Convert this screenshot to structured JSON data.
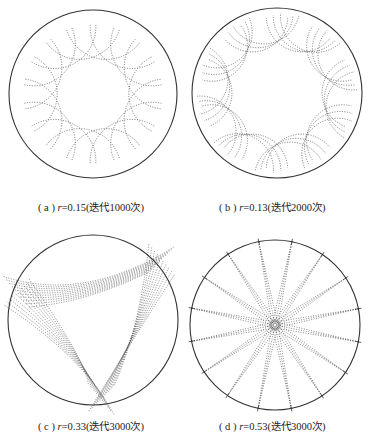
{
  "panels": [
    {
      "id": "a",
      "label": "( a )",
      "var": "r",
      "value": "=0.15",
      "iter": "(迭代1000次)",
      "cx": 93,
      "cy": 94,
      "R": 84,
      "r": 0.15,
      "iterations": 1000
    },
    {
      "id": "b",
      "label": "( b )",
      "var": "r",
      "value": "=0.13",
      "iter": "(迭代2000次)",
      "cx": 277,
      "cy": 93,
      "R": 85,
      "r": 0.13,
      "iterations": 2000
    },
    {
      "id": "c",
      "label": "( c )",
      "var": "r",
      "value": "=0.33",
      "iter": "(迭代3000次)",
      "cx": 93,
      "cy": 320,
      "R": 85,
      "r": 0.33,
      "iterations": 3000
    },
    {
      "id": "d",
      "label": "( d )",
      "var": "r",
      "value": "=0.53",
      "iter": "(迭代3000次)",
      "cx": 275,
      "cy": 325,
      "R": 85,
      "r": 0.53,
      "iterations": 3000
    }
  ],
  "colors": {
    "circle": "#333333",
    "curve": "#555555"
  }
}
